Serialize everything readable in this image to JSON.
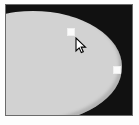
{
  "app": {
    "view_name": "image-canvas",
    "description": "Shape selection on dark canvas"
  },
  "canvas": {
    "background_color": "#111111",
    "border_color": "#6b6b6b",
    "page_background": "#fdfdfd",
    "width_px": 128,
    "height_px": 112
  },
  "shape": {
    "name": "ellipse-selection",
    "fill_color": "#d2d2d2",
    "type": "ellipse"
  },
  "handles": [
    {
      "name": "resize-handle-top",
      "position": "top",
      "color": "#fbfbfb",
      "x": 61,
      "y": 23
    },
    {
      "name": "resize-handle-right",
      "position": "right",
      "color": "#fbfbfb",
      "x": 107,
      "y": 61
    }
  ],
  "cursor": {
    "name": "arrow-pointer",
    "x": 69,
    "y": 32,
    "fill": "#ffffff",
    "stroke": "#000000"
  }
}
